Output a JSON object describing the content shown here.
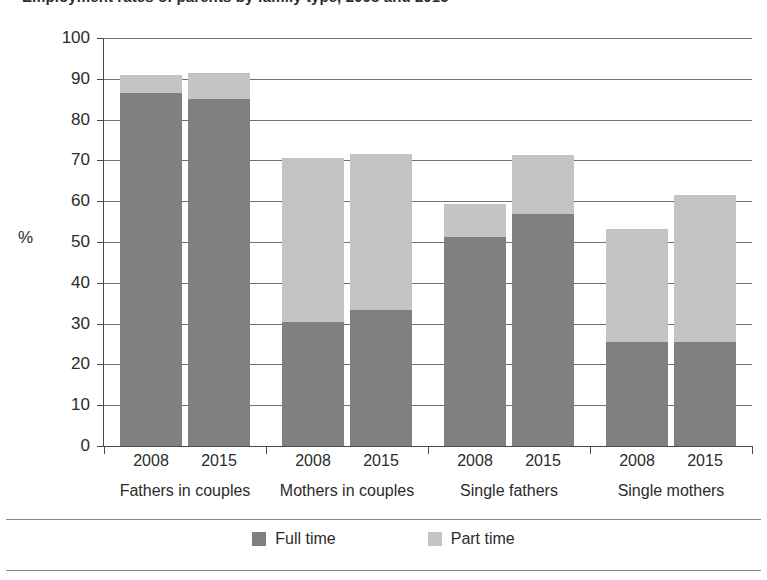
{
  "title": "Employment rates of parents by family type, 2008 and 2015",
  "axis": {
    "ylabel": "%",
    "yticks": [
      "100",
      "90",
      "80",
      "70",
      "60",
      "50",
      "40",
      "30",
      "20",
      "10",
      "0"
    ]
  },
  "legend": {
    "items": [
      {
        "label": "Full time",
        "color": "#808080",
        "name": "full-time"
      },
      {
        "label": "Part time",
        "color": "#c4c4c4",
        "name": "part-time"
      }
    ]
  },
  "groups": [
    {
      "label": "Fathers in couples",
      "bars": [
        {
          "year": "2008",
          "full_time": 86.5,
          "part_time": 4.5,
          "total": 91.0
        },
        {
          "year": "2015",
          "full_time": 85.0,
          "part_time": 6.5,
          "total": 91.5
        }
      ]
    },
    {
      "label": "Mothers in couples",
      "bars": [
        {
          "year": "2008",
          "full_time": 30.3,
          "part_time": 40.2,
          "total": 70.5
        },
        {
          "year": "2015",
          "full_time": 33.3,
          "part_time": 38.2,
          "total": 71.5
        }
      ]
    },
    {
      "label": "Single fathers",
      "bars": [
        {
          "year": "2008",
          "full_time": 51.3,
          "part_time": 8.0,
          "total": 59.3
        },
        {
          "year": "2015",
          "full_time": 56.8,
          "part_time": 14.5,
          "total": 71.3
        }
      ]
    },
    {
      "label": "Single mothers",
      "bars": [
        {
          "year": "2008",
          "full_time": 25.5,
          "part_time": 27.8,
          "total": 53.3
        },
        {
          "year": "2015",
          "full_time": 25.5,
          "part_time": 36.0,
          "total": 61.5
        }
      ]
    }
  ],
  "chart_data": {
    "type": "bar",
    "subtype": "stacked",
    "title": "Employment rates of parents by family type, 2008 and 2015",
    "xlabel": "",
    "ylabel": "%",
    "ylim": [
      0,
      100
    ],
    "ytick_step": 10,
    "grid": true,
    "legend_position": "bottom",
    "categories": [
      "Fathers in couples 2008",
      "Fathers in couples 2015",
      "Mothers in couples 2008",
      "Mothers in couples 2015",
      "Single fathers 2008",
      "Single fathers 2015",
      "Single mothers 2008",
      "Single mothers 2015"
    ],
    "group_labels": [
      "Fathers in couples",
      "Mothers in couples",
      "Single fathers",
      "Single mothers"
    ],
    "years": [
      "2008",
      "2015"
    ],
    "series": [
      {
        "name": "Full time",
        "color": "#808080",
        "values": [
          86.5,
          85.0,
          30.3,
          33.3,
          51.3,
          56.8,
          25.5,
          25.5
        ]
      },
      {
        "name": "Part time",
        "color": "#c4c4c4",
        "values": [
          4.5,
          6.5,
          40.2,
          38.2,
          8.0,
          14.5,
          27.8,
          36.0
        ]
      }
    ],
    "totals": [
      91.0,
      91.5,
      70.5,
      71.5,
      59.3,
      71.3,
      53.3,
      61.5
    ]
  }
}
